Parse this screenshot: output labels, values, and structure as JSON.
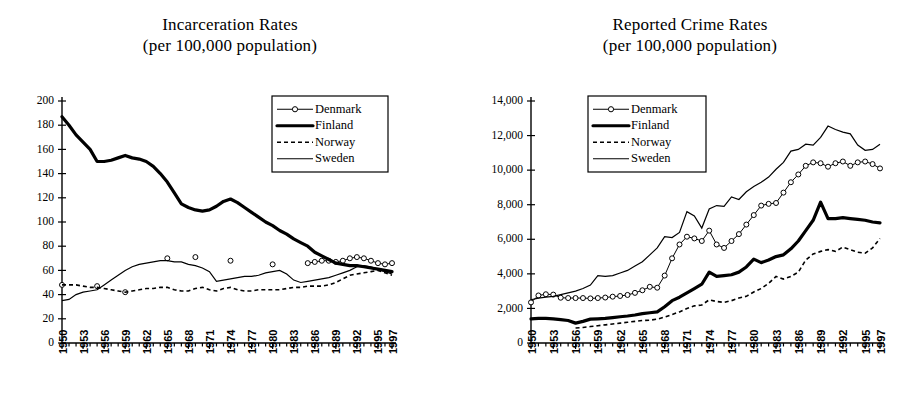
{
  "figure": {
    "background": "#ffffff",
    "ink_color": "#000000"
  },
  "panels": [
    {
      "id": "incarceration",
      "title_line1": "Incarceration Rates",
      "title_line2": "(per 100,000 population)"
    },
    {
      "id": "crime",
      "title_line1": "Reported Crime Rates",
      "title_line2": "(per 100,000 population)"
    }
  ],
  "legend": {
    "entries": [
      {
        "label": "Denmark",
        "style": "thin-line-with-open-circle-markers"
      },
      {
        "label": "Finland",
        "style": "thick-solid-line"
      },
      {
        "label": "Norway",
        "style": "dashed-line"
      },
      {
        "label": "Sweden",
        "style": "thin-solid-line"
      }
    ]
  },
  "chart_data": [
    {
      "type": "line",
      "id": "incarceration",
      "title": "Incarceration Rates (per 100,000 population)",
      "xlabel": "",
      "ylabel": "",
      "xlim": [
        1950,
        1997
      ],
      "ylim": [
        0,
        200
      ],
      "ytick_step": 20,
      "yticks": [
        0,
        20,
        40,
        60,
        80,
        100,
        120,
        140,
        160,
        180,
        200
      ],
      "ytick_labels": [
        "0",
        "20",
        "40",
        "60",
        "80",
        "100",
        "120",
        "140",
        "160",
        "180",
        "200"
      ],
      "xticks": [
        1950,
        1953,
        1956,
        1959,
        1962,
        1965,
        1968,
        1971,
        1974,
        1977,
        1980,
        1983,
        1986,
        1989,
        1992,
        1995,
        1997
      ],
      "xtick_labels": [
        "1950",
        "1953",
        "1956",
        "1959",
        "1962",
        "1965",
        "1968",
        "1971",
        "1974",
        "1977",
        "1980",
        "1983",
        "1986",
        "1989",
        "1992",
        "1995",
        "1997"
      ],
      "grid": false,
      "legend_position": "top-right",
      "x": [
        1950,
        1951,
        1952,
        1953,
        1954,
        1955,
        1956,
        1957,
        1958,
        1959,
        1960,
        1961,
        1962,
        1963,
        1964,
        1965,
        1966,
        1967,
        1968,
        1969,
        1970,
        1971,
        1972,
        1973,
        1974,
        1975,
        1976,
        1977,
        1978,
        1979,
        1980,
        1981,
        1982,
        1983,
        1984,
        1985,
        1986,
        1987,
        1988,
        1989,
        1990,
        1991,
        1992,
        1993,
        1994,
        1995,
        1996,
        1997
      ],
      "series": [
        {
          "name": "Denmark",
          "values": [
            48,
            null,
            null,
            null,
            null,
            47,
            null,
            null,
            null,
            42,
            null,
            null,
            null,
            null,
            null,
            70,
            null,
            null,
            null,
            71,
            null,
            null,
            null,
            null,
            68,
            null,
            null,
            null,
            null,
            null,
            65,
            null,
            null,
            null,
            null,
            66,
            67,
            68,
            68,
            67,
            68,
            70,
            71,
            70,
            68,
            66,
            65,
            66
          ],
          "markers": "open-circle"
        },
        {
          "name": "Finland",
          "values": [
            187,
            180,
            172,
            166,
            160,
            150,
            150,
            151,
            153,
            155,
            153,
            152,
            150,
            146,
            140,
            133,
            124,
            115,
            112,
            110,
            109,
            110,
            113,
            117,
            119,
            116,
            112,
            108,
            104,
            100,
            97,
            93,
            90,
            86,
            83,
            80,
            75,
            72,
            69,
            66,
            65,
            64,
            64,
            63,
            62,
            61,
            60,
            59
          ]
        },
        {
          "name": "Norway",
          "values": [
            48,
            48,
            48,
            47,
            46,
            46,
            45,
            44,
            43,
            42,
            43,
            44,
            45,
            45,
            46,
            46,
            44,
            43,
            43,
            45,
            46,
            44,
            43,
            45,
            46,
            44,
            43,
            43,
            44,
            44,
            44,
            44,
            45,
            46,
            46,
            47,
            47,
            47,
            48,
            50,
            53,
            56,
            57,
            58,
            59,
            60,
            58,
            56
          ]
        },
        {
          "name": "Sweden",
          "values": [
            35,
            36,
            40,
            42,
            43,
            44,
            48,
            52,
            56,
            60,
            63,
            65,
            66,
            67,
            68,
            68,
            67,
            67,
            65,
            64,
            62,
            59,
            51,
            52,
            53,
            54,
            55,
            55,
            56,
            58,
            59,
            60,
            57,
            52,
            50,
            51,
            52,
            53,
            54,
            56,
            58,
            60,
            63,
            64,
            63,
            61,
            59,
            57
          ]
        }
      ]
    },
    {
      "type": "line",
      "id": "crime",
      "title": "Reported Crime Rates (per 100,000 population)",
      "xlabel": "",
      "ylabel": "",
      "xlim": [
        1950,
        1997
      ],
      "ylim": [
        0,
        14000
      ],
      "ytick_step": 2000,
      "yticks": [
        0,
        2000,
        4000,
        6000,
        8000,
        10000,
        12000,
        14000
      ],
      "ytick_labels": [
        "0",
        "2,000",
        "4,000",
        "6,000",
        "8,000",
        "10,000",
        "12,000",
        "14,000"
      ],
      "xticks": [
        1950,
        1953,
        1956,
        1959,
        1962,
        1965,
        1968,
        1971,
        1974,
        1977,
        1980,
        1983,
        1986,
        1989,
        1992,
        1995,
        1997
      ],
      "xtick_labels": [
        "1950",
        "1953",
        "1956",
        "1959",
        "1962",
        "1965",
        "1968",
        "1971",
        "1974",
        "1977",
        "1980",
        "1983",
        "1986",
        "1989",
        "1992",
        "1995",
        "1997"
      ],
      "grid": false,
      "legend_position": "top-center",
      "x": [
        1950,
        1951,
        1952,
        1953,
        1954,
        1955,
        1956,
        1957,
        1958,
        1959,
        1960,
        1961,
        1962,
        1963,
        1964,
        1965,
        1966,
        1967,
        1968,
        1969,
        1970,
        1971,
        1972,
        1973,
        1974,
        1975,
        1976,
        1977,
        1978,
        1979,
        1980,
        1981,
        1982,
        1983,
        1984,
        1985,
        1986,
        1987,
        1988,
        1989,
        1990,
        1991,
        1992,
        1993,
        1994,
        1995,
        1996,
        1997
      ],
      "series": [
        {
          "name": "Denmark",
          "values": [
            2350,
            2750,
            2820,
            2800,
            2620,
            2600,
            2600,
            2600,
            2580,
            2600,
            2630,
            2680,
            2720,
            2780,
            2900,
            3050,
            3250,
            3200,
            3900,
            4900,
            5700,
            6150,
            6050,
            5900,
            6500,
            5700,
            5500,
            5900,
            6300,
            6850,
            7400,
            7950,
            8050,
            8100,
            8700,
            9300,
            9750,
            10250,
            10450,
            10400,
            10200,
            10400,
            10500,
            10250,
            10450,
            10500,
            10350,
            10100
          ],
          "markers": "open-circle"
        },
        {
          "name": "Finland",
          "values": [
            1400,
            1420,
            1430,
            1400,
            1350,
            1300,
            1150,
            1250,
            1380,
            1400,
            1420,
            1470,
            1520,
            1560,
            1620,
            1700,
            1750,
            1800,
            2100,
            2450,
            2650,
            2900,
            3150,
            3400,
            4100,
            3850,
            3900,
            3950,
            4100,
            4400,
            4850,
            4650,
            4800,
            5000,
            5100,
            5450,
            5900,
            6500,
            7100,
            8150,
            7200,
            7200,
            7250,
            7200,
            7150,
            7100,
            7000,
            6950
          ]
        },
        {
          "name": "Norway",
          "values": [
            null,
            null,
            null,
            null,
            null,
            null,
            870,
            900,
            950,
            1000,
            1050,
            1100,
            1150,
            1200,
            1250,
            1300,
            1320,
            1380,
            1500,
            1650,
            1800,
            2000,
            2150,
            2200,
            2500,
            2400,
            2350,
            2450,
            2600,
            2700,
            2950,
            3150,
            3450,
            3850,
            3700,
            3850,
            4100,
            4800,
            5150,
            5300,
            5400,
            5300,
            5550,
            5400,
            5250,
            5200,
            5500,
            6050
          ]
        },
        {
          "name": "Sweden",
          "values": [
            2500,
            2600,
            2650,
            2700,
            2800,
            2900,
            3000,
            3150,
            3350,
            3900,
            3850,
            3900,
            4050,
            4200,
            4450,
            4700,
            5100,
            5500,
            6150,
            6100,
            6400,
            7600,
            7350,
            6650,
            7750,
            7950,
            7900,
            8450,
            8300,
            8750,
            9050,
            9300,
            9600,
            10050,
            10450,
            11100,
            11200,
            11500,
            11450,
            11900,
            12550,
            12350,
            12200,
            12100,
            11450,
            11150,
            11200,
            11500
          ]
        }
      ]
    }
  ]
}
